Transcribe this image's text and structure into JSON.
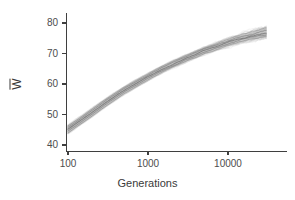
{
  "chart_data": {
    "type": "line",
    "title": "",
    "subtitle": "",
    "xlabel": "Generations",
    "ylabel": "W̄",
    "ylabel_glyph": "W",
    "xscale": "log",
    "yscale": "linear",
    "xlim": [
      100,
      30000
    ],
    "ylim": [
      38,
      82
    ],
    "grid": false,
    "legend": null,
    "annotations": [],
    "xticks": [
      100,
      1000,
      10000
    ],
    "xtick_labels": [
      "100",
      "1000",
      "10000"
    ],
    "yticks": [
      40,
      50,
      60,
      70,
      80
    ],
    "ytick_labels": [
      "40",
      "50",
      "60",
      "70",
      "80"
    ],
    "x": [
      100,
      150,
      200,
      300,
      500,
      700,
      1000,
      1500,
      2000,
      3000,
      5000,
      7000,
      10000,
      15000,
      20000,
      30000
    ],
    "series": [
      {
        "name": "median",
        "color": "#5a5a5a",
        "values": [
          45.2,
          48.4,
          50.7,
          54.0,
          57.9,
          60.1,
          62.4,
          64.9,
          66.4,
          68.5,
          70.9,
          72.2,
          73.6,
          75.0,
          75.8,
          76.8
        ]
      },
      {
        "name": "upper_envelope",
        "color": "#b4b4b4",
        "values": [
          46.6,
          49.8,
          52.1,
          55.4,
          59.2,
          61.4,
          63.6,
          66.1,
          67.6,
          69.7,
          72.1,
          73.4,
          74.9,
          76.5,
          77.4,
          78.6
        ]
      },
      {
        "name": "lower_envelope",
        "color": "#b4b4b4",
        "values": [
          43.6,
          46.9,
          49.2,
          52.5,
          56.5,
          58.7,
          61.0,
          63.6,
          65.1,
          67.2,
          69.6,
          70.9,
          72.3,
          73.6,
          74.3,
          75.0
        ]
      }
    ],
    "band_color": "#bdbdbd",
    "line_color": "#555555",
    "axis_color": "#3f3f3f",
    "background_color": "#ffffff"
  },
  "axes": {
    "x_tick_positions_px": [
      68,
      148,
      228
    ],
    "y_tick_positions_px": [
      145,
      114.5,
      84,
      53.5,
      23
    ]
  }
}
